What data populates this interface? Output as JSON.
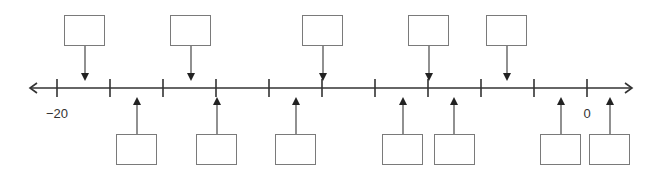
{
  "number_line": {
    "min": -20,
    "max": 0,
    "step": 2,
    "labels": [
      {
        "value": -20,
        "text": "−20"
      },
      {
        "value": 0,
        "text": "0"
      }
    ],
    "y": 88,
    "x_start": 30,
    "x_end": 632,
    "tick_x_min": 57,
    "tick_x_max": 587,
    "line_color": "#333333",
    "box_border_color": "#7a7a7a"
  },
  "top_boxes": [
    {
      "id": 1,
      "box_x": 64,
      "arrow_x": 85,
      "value": ""
    },
    {
      "id": 2,
      "box_x": 170,
      "arrow_x": 191,
      "value": ""
    },
    {
      "id": 3,
      "box_x": 302,
      "arrow_x": 323,
      "value": ""
    },
    {
      "id": 4,
      "box_x": 408,
      "arrow_x": 429,
      "value": ""
    },
    {
      "id": 5,
      "box_x": 486,
      "arrow_x": 507,
      "value": ""
    }
  ],
  "bottom_boxes": [
    {
      "id": 1,
      "box_x": 116,
      "arrow_x": 137,
      "value": ""
    },
    {
      "id": 2,
      "box_x": 196,
      "arrow_x": 217,
      "value": ""
    },
    {
      "id": 3,
      "box_x": 275,
      "arrow_x": 296,
      "value": ""
    },
    {
      "id": 4,
      "box_x": 382,
      "arrow_x": 403,
      "value": ""
    },
    {
      "id": 5,
      "box_x": 434,
      "arrow_x": 454,
      "value": ""
    },
    {
      "id": 6,
      "box_x": 540,
      "arrow_x": 561,
      "value": ""
    },
    {
      "id": 7,
      "box_x": 589,
      "arrow_x": 610,
      "value": ""
    }
  ]
}
